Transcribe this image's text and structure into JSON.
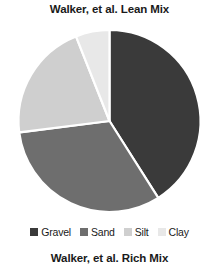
{
  "chart_data": {
    "type": "pie",
    "title": "Walker, et al. Lean Mix",
    "categories": [
      "Gravel",
      "Sand",
      "Silt",
      "Clay"
    ],
    "values": [
      41,
      32,
      21,
      6
    ],
    "unit": "percent",
    "colors": [
      "#3a3a3a",
      "#6e6e6e",
      "#cfcfcf",
      "#e8e8e8"
    ],
    "slice_border_color": "#ffffff",
    "start_angle_deg": 0,
    "direction": "clockwise",
    "legend_position": "bottom",
    "grid": false,
    "xlabel": "",
    "ylabel": "",
    "slices": [
      {
        "label": "Gravel",
        "value": 41,
        "color": "#3a3a3a",
        "start_deg": 0,
        "end_deg": 147.6
      },
      {
        "label": "Sand",
        "value": 32,
        "color": "#6e6e6e",
        "start_deg": 147.6,
        "end_deg": 262.8
      },
      {
        "label": "Silt",
        "value": 21,
        "color": "#cfcfcf",
        "start_deg": 262.8,
        "end_deg": 338.4
      },
      {
        "label": "Clay",
        "value": 6,
        "color": "#e8e8e8",
        "start_deg": 338.4,
        "end_deg": 360
      }
    ]
  },
  "legend": {
    "items": [
      {
        "label": "Gravel",
        "color": "#3a3a3a"
      },
      {
        "label": "Sand",
        "color": "#6e6e6e"
      },
      {
        "label": "Silt",
        "color": "#cfcfcf"
      },
      {
        "label": "Clay",
        "color": "#e8e8e8"
      }
    ]
  },
  "next_chart": {
    "title": "Walker, et al. Rich Mix"
  }
}
